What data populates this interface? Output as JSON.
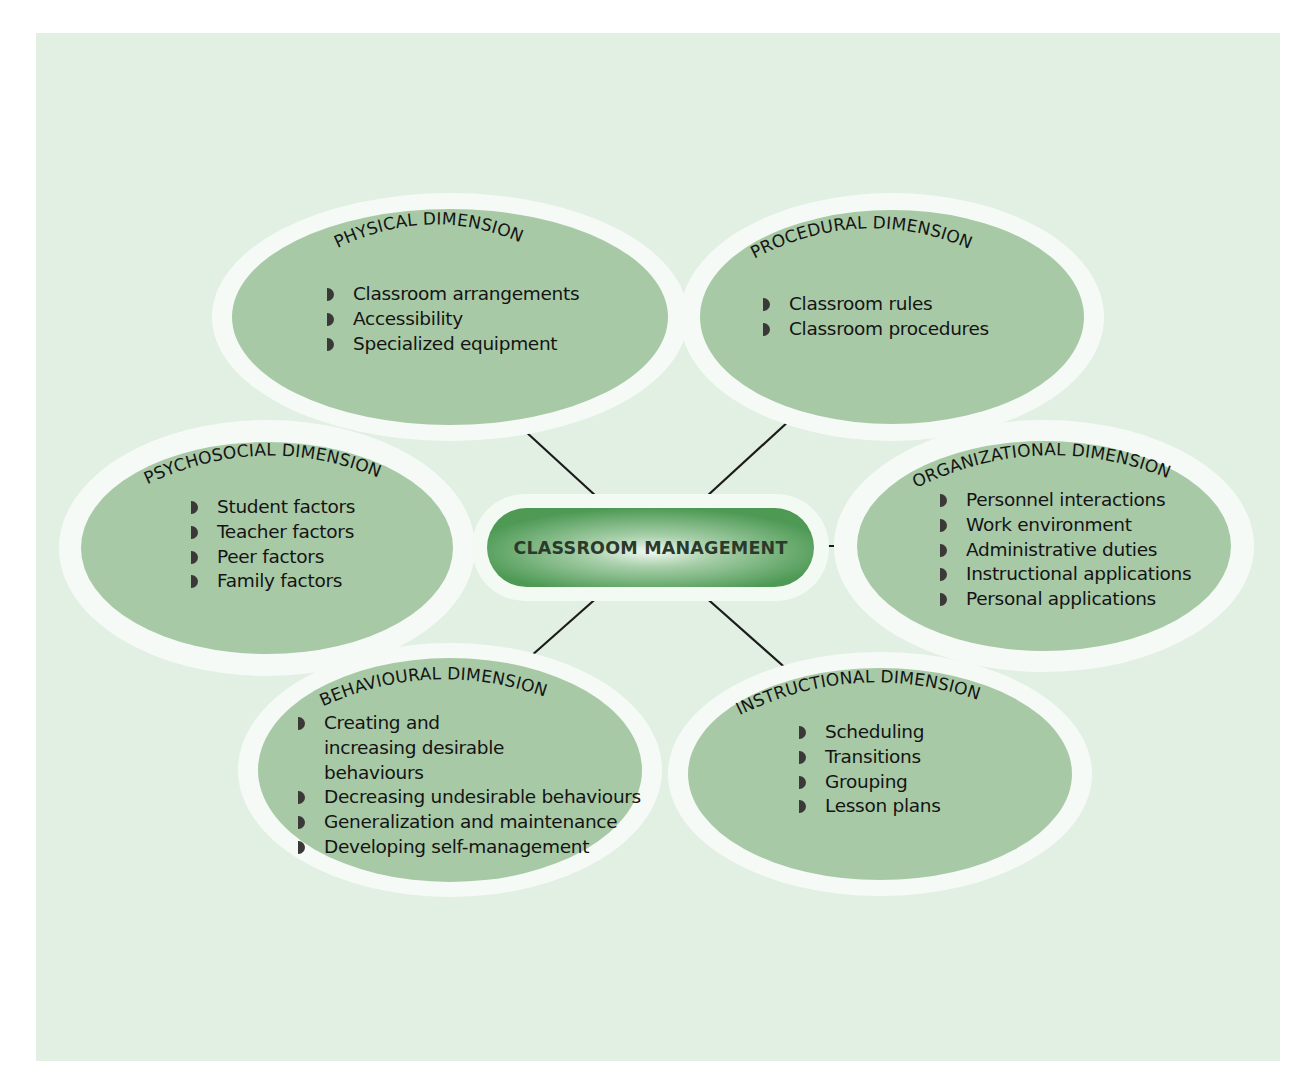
{
  "diagram": {
    "center": {
      "label": "CLASSROOM MANAGEMENT"
    },
    "colors": {
      "panel_background": "#e2efe3",
      "ellipse_fill": "#a8c9a6",
      "ellipse_ring": "#f6faf6",
      "center_dark": "#4e9a55",
      "center_light": "#eef6ee",
      "connector": "#1b1b1b",
      "bullet": "#3b3838"
    },
    "dimensions": [
      {
        "id": "physical",
        "title": "PHYSICAL DIMENSION",
        "items": [
          "Classroom arrangements",
          "Accessibility",
          "Specialized equipment"
        ]
      },
      {
        "id": "procedural",
        "title": "PROCEDURAL DIMENSION",
        "items": [
          "Classroom rules",
          "Classroom procedures"
        ]
      },
      {
        "id": "psychosocial",
        "title": "PSYCHOSOCIAL DIMENSION",
        "items": [
          "Student factors",
          "Teacher factors",
          "Peer factors",
          "Family factors"
        ]
      },
      {
        "id": "organizational",
        "title": "ORGANIZATIONAL DIMENSION",
        "items": [
          "Personnel interactions",
          "Work environment",
          "Administrative duties",
          "Instructional applications",
          "Personal applications"
        ]
      },
      {
        "id": "behavioural",
        "title": "BEHAVIOURAL DIMENSION",
        "items": [
          "Creating and increasing desirable behaviours",
          "Decreasing undesirable behaviours",
          "Generalization and maintenance",
          "Developing self-management"
        ]
      },
      {
        "id": "instructional",
        "title": "INSTRUCTIONAL DIMENSION",
        "items": [
          "Scheduling",
          "Transitions",
          "Grouping",
          "Lesson plans"
        ]
      }
    ]
  }
}
